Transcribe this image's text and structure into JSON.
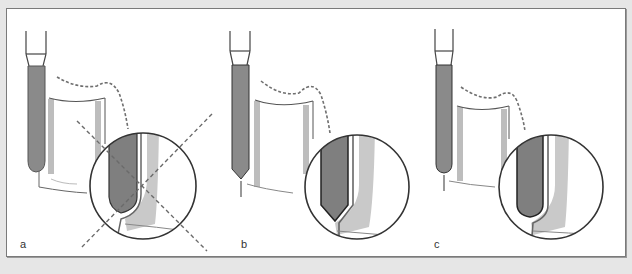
{
  "figure": {
    "panels": [
      {
        "id": "a",
        "label": "a",
        "crossed_out": true,
        "tip_shape": "round",
        "tip_contacts_margin": true
      },
      {
        "id": "b",
        "label": "b",
        "crossed_out": false,
        "tip_shape": "pointed",
        "tip_contacts_margin": false
      },
      {
        "id": "c",
        "label": "c",
        "crossed_out": false,
        "tip_shape": "round",
        "tip_contacts_margin": false
      }
    ]
  },
  "colors": {
    "background": "#e6e6e6",
    "panel": "#ffffff",
    "frame_border": "#7a7a7a",
    "bur_fill": "#8a8a8a",
    "bur_outline": "#222222",
    "tooth_wall": "#c9c9c9",
    "dashed_line": "#6f6f6f",
    "outline": "#3a3a3a"
  }
}
